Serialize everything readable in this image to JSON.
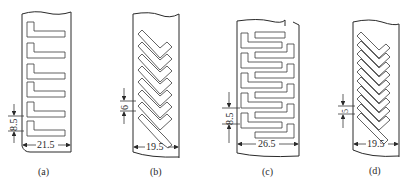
{
  "figure": {
    "panels": [
      {
        "id": "a",
        "label": "(a)",
        "pattern": "L-shaped slots, horizontal, stacked (6 slots)",
        "pitch_label": "8.5",
        "width_label": "21.5"
      },
      {
        "id": "b",
        "label": "(b)",
        "pattern": "V/chevron slots, inclined (7 slots)",
        "pitch_label": "6",
        "width_label": "19.5"
      },
      {
        "id": "c",
        "label": "(c)",
        "pattern": "interlocking L-shaped slots from both sides",
        "pitch_label": "8.5",
        "width_label": "26.5"
      },
      {
        "id": "d",
        "label": "(d)",
        "pattern": "V/chevron slots, inclined, denser (9 slots)",
        "pitch_label": "5",
        "width_label": "19.5"
      }
    ]
  }
}
